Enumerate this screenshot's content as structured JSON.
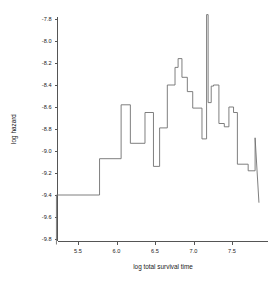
{
  "chart_data": {
    "type": "line",
    "variant": "step",
    "title": "",
    "xlabel": "log total survival time",
    "ylabel": "log hazard",
    "xlim": [
      5.22,
      7.88
    ],
    "ylim": [
      -9.85,
      -7.75
    ],
    "xticks": [
      5.5,
      6.0,
      6.5,
      7.0,
      7.5
    ],
    "xtick_labels": [
      "5.5",
      "6.0",
      "6.5",
      "7.0",
      "7.5"
    ],
    "yticks": [
      -7.8,
      -8.0,
      -8.2,
      -8.4,
      -8.6,
      -8.8,
      -9.0,
      -9.2,
      -9.4,
      -9.6,
      -9.8
    ],
    "ytick_labels": [
      "-7.8",
      "-8.0",
      "-8.2",
      "-8.4",
      "-8.6",
      "-8.8",
      "-9.0",
      "-9.2",
      "-9.4",
      "-9.6",
      "-9.8"
    ],
    "grid": false,
    "legend": null,
    "series": [
      {
        "name": "log hazard step function",
        "color": "#707070",
        "x": [
          5.22,
          5.22,
          5.78,
          5.78,
          6.06,
          6.06,
          6.18,
          6.18,
          6.37,
          6.37,
          6.48,
          6.48,
          6.56,
          6.56,
          6.66,
          6.66,
          6.76,
          6.76,
          6.8,
          6.8,
          6.85,
          6.85,
          6.92,
          6.92,
          6.99,
          6.99,
          7.11,
          7.11,
          7.17,
          7.17,
          7.19,
          7.19,
          7.23,
          7.23,
          7.26,
          7.26,
          7.33,
          7.33,
          7.4,
          7.4,
          7.46,
          7.46,
          7.52,
          7.52,
          7.57,
          7.57,
          7.71,
          7.71,
          7.8,
          7.8,
          7.85
        ],
        "y": [
          -9.85,
          -9.4,
          -9.4,
          -9.07,
          -9.07,
          -8.58,
          -8.58,
          -8.93,
          -8.93,
          -8.65,
          -8.65,
          -9.14,
          -9.14,
          -8.79,
          -8.79,
          -8.4,
          -8.4,
          -8.24,
          -8.24,
          -8.16,
          -8.16,
          -8.33,
          -8.33,
          -8.46,
          -8.46,
          -8.61,
          -8.61,
          -8.89,
          -8.89,
          -7.76,
          -7.76,
          -8.56,
          -8.56,
          -8.41,
          -8.41,
          -8.4,
          -8.4,
          -8.75,
          -8.75,
          -8.78,
          -8.78,
          -8.6,
          -8.6,
          -8.65,
          -8.65,
          -9.12,
          -9.12,
          -9.18,
          -9.18,
          -8.88,
          -9.47
        ],
        "steps": [
          {
            "x_start": 5.22,
            "x_end": 5.78,
            "value": -9.4
          },
          {
            "x_start": 5.78,
            "x_end": 6.06,
            "value": -9.07
          },
          {
            "x_start": 6.06,
            "x_end": 6.18,
            "value": -8.58
          },
          {
            "x_start": 6.18,
            "x_end": 6.37,
            "value": -8.93
          },
          {
            "x_start": 6.37,
            "x_end": 6.48,
            "value": -8.65
          },
          {
            "x_start": 6.48,
            "x_end": 6.56,
            "value": -9.14
          },
          {
            "x_start": 6.56,
            "x_end": 6.66,
            "value": -8.79
          },
          {
            "x_start": 6.66,
            "x_end": 6.76,
            "value": -8.4
          },
          {
            "x_start": 6.76,
            "x_end": 6.8,
            "value": -8.24
          },
          {
            "x_start": 6.8,
            "x_end": 6.85,
            "value": -8.16
          },
          {
            "x_start": 6.85,
            "x_end": 6.92,
            "value": -8.33
          },
          {
            "x_start": 6.92,
            "x_end": 6.99,
            "value": -8.46
          },
          {
            "x_start": 6.99,
            "x_end": 7.11,
            "value": -8.61
          },
          {
            "x_start": 7.11,
            "x_end": 7.17,
            "value": -8.89
          },
          {
            "x_start": 7.17,
            "x_end": 7.19,
            "value": -7.76
          },
          {
            "x_start": 7.19,
            "x_end": 7.23,
            "value": -8.56
          },
          {
            "x_start": 7.23,
            "x_end": 7.26,
            "value": -8.41
          },
          {
            "x_start": 7.26,
            "x_end": 7.33,
            "value": -8.4
          },
          {
            "x_start": 7.33,
            "x_end": 7.4,
            "value": -8.75
          },
          {
            "x_start": 7.4,
            "x_end": 7.46,
            "value": -8.78
          },
          {
            "x_start": 7.46,
            "x_end": 7.52,
            "value": -8.6
          },
          {
            "x_start": 7.52,
            "x_end": 7.57,
            "value": -8.65
          },
          {
            "x_start": 7.57,
            "x_end": 7.71,
            "value": -9.12
          },
          {
            "x_start": 7.71,
            "x_end": 7.8,
            "value": -9.18
          },
          {
            "x_start": 7.8,
            "x_end": 7.85,
            "value": -8.88
          }
        ]
      }
    ]
  }
}
